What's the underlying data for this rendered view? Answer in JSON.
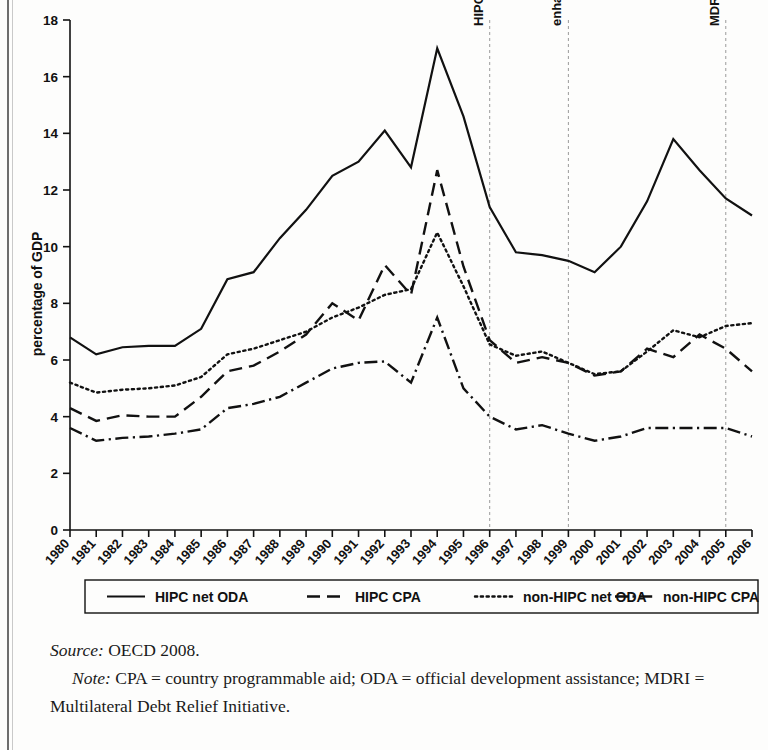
{
  "figure": {
    "ylabel": "percentage of GDP",
    "source_lead": "Source:",
    "source_text": " OECD 2008.",
    "note_lead": "Note:",
    "note_text": " CPA = country programmable aid; ODA = official development assistance; MDRI = Multilateral Debt Relief Initiative."
  },
  "chart_data": {
    "type": "line",
    "title": "",
    "xlabel": "",
    "ylabel": "percentage of GDP",
    "xlim": [
      1980,
      2006
    ],
    "ylim": [
      0,
      18
    ],
    "ytick_values": [
      0,
      2,
      4,
      6,
      8,
      10,
      12,
      14,
      16,
      18
    ],
    "ytick_labels": [
      "0",
      "2",
      "4",
      "6",
      "8",
      "10",
      "12",
      "14",
      "16",
      "18"
    ],
    "grid": false,
    "legend_position": "below-axes",
    "x": [
      1980,
      1981,
      1982,
      1983,
      1984,
      1985,
      1986,
      1987,
      1988,
      1989,
      1990,
      1991,
      1992,
      1993,
      1994,
      1995,
      1996,
      1997,
      1998,
      1999,
      2000,
      2001,
      2002,
      2003,
      2004,
      2005,
      2006
    ],
    "xtick_labels": [
      "1980",
      "1981",
      "1982",
      "1983",
      "1984",
      "1985",
      "1986",
      "1987",
      "1988",
      "1989",
      "1990",
      "1991",
      "1992",
      "1993",
      "1994",
      "1995",
      "1996",
      "1997",
      "1998",
      "1999",
      "2000",
      "2001",
      "2002",
      "2003",
      "2004",
      "2005",
      "2006"
    ],
    "series": [
      {
        "name": "HIPC net ODA",
        "style": "solid",
        "color": "#111111",
        "values": [
          6.8,
          6.2,
          6.45,
          6.5,
          6.5,
          7.1,
          8.85,
          9.1,
          10.3,
          11.3,
          12.5,
          13.0,
          14.1,
          12.8,
          17.0,
          14.6,
          11.4,
          9.8,
          9.7,
          9.5,
          9.1,
          10.0,
          11.6,
          13.8,
          12.7,
          11.7,
          11.1
        ]
      },
      {
        "name": "HIPC CPA",
        "style": "dashed",
        "color": "#111111",
        "values": [
          4.3,
          3.85,
          4.05,
          4.0,
          4.0,
          4.7,
          5.6,
          5.8,
          6.3,
          6.9,
          8.0,
          7.4,
          9.35,
          8.3,
          12.7,
          9.3,
          6.7,
          5.9,
          6.1,
          5.9,
          5.45,
          5.6,
          6.4,
          6.1,
          6.9,
          6.4,
          5.6
        ]
      },
      {
        "name": "non-HIPC net ODA",
        "style": "dotted",
        "color": "#111111",
        "values": [
          5.2,
          4.85,
          4.95,
          5.0,
          5.1,
          5.4,
          6.2,
          6.4,
          6.7,
          7.0,
          7.5,
          7.85,
          8.3,
          8.5,
          10.5,
          8.6,
          6.55,
          6.15,
          6.3,
          5.9,
          5.5,
          5.6,
          6.3,
          7.05,
          6.8,
          7.2,
          7.3
        ]
      },
      {
        "name": "non-HIPC CPA",
        "style": "dashdot",
        "color": "#111111",
        "values": [
          3.6,
          3.15,
          3.25,
          3.3,
          3.4,
          3.55,
          4.3,
          4.45,
          4.7,
          5.2,
          5.7,
          5.9,
          5.95,
          5.2,
          7.5,
          5.0,
          4.0,
          3.55,
          3.7,
          3.4,
          3.15,
          3.3,
          3.6,
          3.6,
          3.6,
          3.6,
          3.3
        ]
      }
    ],
    "annotations": [
      {
        "label": "HIPC",
        "x": 1996,
        "style": "vertical-dashed"
      },
      {
        "label": "enhanced HIPC",
        "x": 1999,
        "style": "vertical-dashed"
      },
      {
        "label": "MDRI",
        "x": 2005,
        "style": "vertical-dashed"
      }
    ]
  }
}
